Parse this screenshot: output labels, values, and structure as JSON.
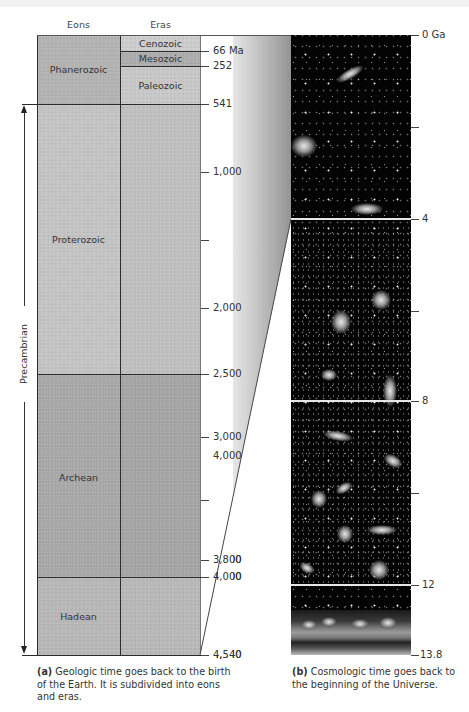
{
  "figure": {
    "panel_a": {
      "headers": {
        "eons": "Eons",
        "eras": "Eras"
      },
      "eons": [
        {
          "name": "Phanerozoic",
          "start_ma": 0,
          "end_ma": 541
        },
        {
          "name": "Proterozoic",
          "start_ma": 541,
          "end_ma": 2500
        },
        {
          "name": "Archean",
          "start_ma": 2500,
          "end_ma": 4000
        },
        {
          "name": "Hadean",
          "start_ma": 4000,
          "end_ma": 4540
        }
      ],
      "eras": [
        {
          "name": "Cenozoic",
          "start_ma": 0,
          "end_ma": 66
        },
        {
          "name": "Mesozoic",
          "start_ma": 66,
          "end_ma": 252
        },
        {
          "name": "Paleozoic",
          "start_ma": 252,
          "end_ma": 541
        }
      ],
      "precambrian_label": "Precambrian",
      "tick_labels": {
        "t66": "66 Ma",
        "t252": "252",
        "t541": "541",
        "t1000": "1,000",
        "t2000": "2,000",
        "t2500": "2,500",
        "t3000": "3,000",
        "t4000_upper": "4,000",
        "t3800": "3,800",
        "t4000": "4,000",
        "t4540": "4,540"
      },
      "caption_label": "(a)",
      "caption_text": "Geologic time goes back to the birth of the Earth. It is subdivided into eons and eras."
    },
    "panel_b": {
      "tick_labels": {
        "t0": "0 Ga",
        "t4": "4",
        "t8": "8",
        "t12": "12",
        "t13_8": "13.8"
      },
      "caption_label": "(b)",
      "caption_text": "Cosmologic time goes back to the beginning of the Universe."
    },
    "colors": {
      "phanerozoic": "#b4b4b4",
      "proterozoic": "#c2c2c2",
      "archean": "#a8a8a8",
      "hadean": "#b6b6b6",
      "cosmic_background": "#030303"
    }
  }
}
